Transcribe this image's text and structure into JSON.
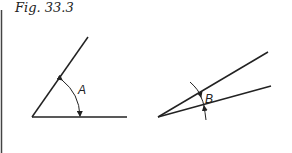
{
  "figure": {
    "caption": "Fig. 33.3",
    "angles": [
      {
        "label": "A",
        "vertex": [
          32,
          117
        ],
        "ray1_end": [
          127,
          117
        ],
        "ray2_end": [
          88,
          37
        ],
        "description": "wide angle with curved double-headed arrow"
      },
      {
        "label": "B",
        "vertex": [
          158,
          117
        ],
        "ray1_end": [
          271,
          86
        ],
        "ray2_end": [
          268,
          52
        ],
        "description": "narrow angle with arrows pointing inward from outside"
      }
    ],
    "colors": {
      "line": "#222222",
      "background": "#ffffff"
    }
  }
}
